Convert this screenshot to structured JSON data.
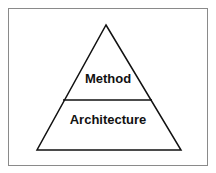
{
  "diagram": {
    "type": "pyramid",
    "layers": [
      {
        "label": "Method",
        "position": "top"
      },
      {
        "label": "Architecture",
        "position": "bottom"
      }
    ],
    "colors": {
      "stroke": "#111111",
      "frame": "#8a8a8a",
      "fill": "#ffffff",
      "text": "#111111"
    }
  }
}
